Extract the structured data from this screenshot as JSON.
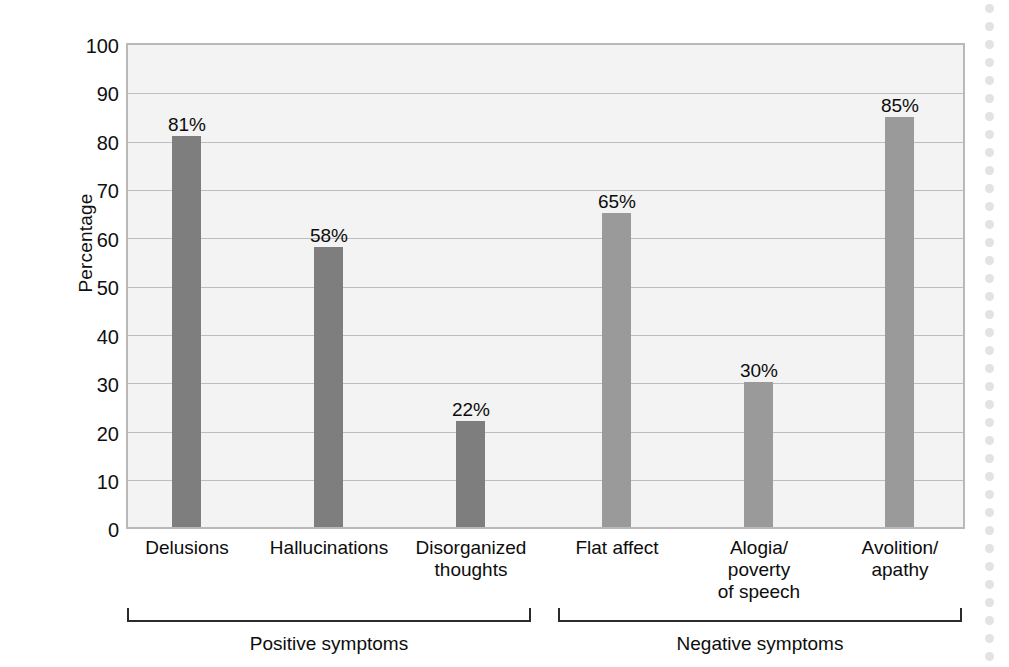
{
  "chart_data": {
    "type": "bar",
    "title": "",
    "xlabel": "",
    "ylabel": "Percentage",
    "ylim": [
      0,
      100
    ],
    "ytick_step": 10,
    "grid": true,
    "legend": "none",
    "categories": [
      "Delusions",
      "Hallucinations",
      "Disorganized\nthoughts",
      "Flat affect",
      "Alogia/\npoverty\nof speech",
      "Avolition/\napathy"
    ],
    "values": [
      81,
      58,
      22,
      65,
      30,
      85
    ],
    "value_labels": [
      "81%",
      "58%",
      "22%",
      "65%",
      "30%",
      "85%"
    ],
    "ytick_labels": [
      "100",
      "90",
      "80",
      "70",
      "60",
      "50",
      "40",
      "30",
      "20",
      "10",
      "0"
    ],
    "groups": [
      {
        "label": "Positive symptoms",
        "categories": [
          "Delusions",
          "Hallucinations",
          "Disorganized thoughts"
        ],
        "color": "#7e7e7e"
      },
      {
        "label": "Negative symptoms",
        "categories": [
          "Flat affect",
          "Alogia/poverty of speech",
          "Avolition/apathy"
        ],
        "color": "#9a9a9a"
      }
    ],
    "colors": {
      "positive_bar": "#7e7e7e",
      "negative_bar": "#9a9a9a",
      "plot_background": "#f3f3f3",
      "gridline": "#bdbdbd",
      "axis_border": "#b9b9b9",
      "text": "#0d0d0d"
    }
  },
  "axis": {
    "y_title": "Percentage"
  },
  "category_lines": {
    "c0": [
      "Delusions"
    ],
    "c1": [
      "Hallucinations"
    ],
    "c2_l1": "Disorganized",
    "c2_l2": "thoughts",
    "c3": "Flat affect",
    "c4_l1": "Alogia/",
    "c4_l2": "poverty",
    "c4_l3": "of speech",
    "c5_l1": "Avolition/",
    "c5_l2": "apathy"
  },
  "value_labels": {
    "v0": "81%",
    "v1": "58%",
    "v2": "22%",
    "v3": "65%",
    "v4": "30%",
    "v5": "85%"
  },
  "ytick_labels": {
    "t100": "100",
    "t90": "90",
    "t80": "80",
    "t70": "70",
    "t60": "60",
    "t50": "50",
    "t40": "40",
    "t30": "30",
    "t20": "20",
    "t10": "10",
    "t0": "0"
  },
  "groups": {
    "positive": "Positive symptoms",
    "negative": "Negative symptoms"
  }
}
